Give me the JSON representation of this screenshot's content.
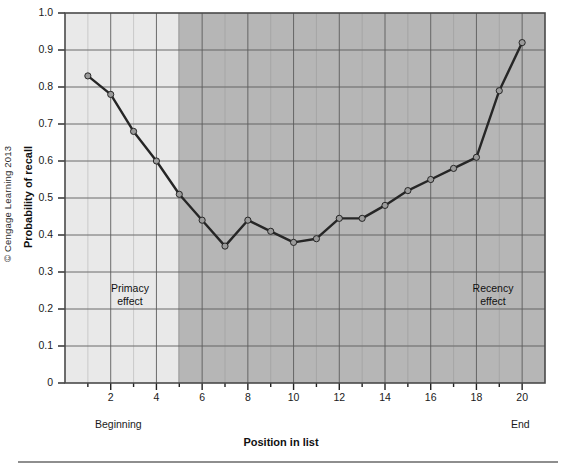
{
  "figure": {
    "copyright": "© Cengage Learning 2013"
  },
  "chart_data": {
    "type": "line",
    "title": "",
    "xlabel": "Position in list",
    "ylabel": "Probability of recall",
    "xlim": [
      0,
      21
    ],
    "ylim": [
      0,
      1.0
    ],
    "grid": true,
    "legend": null,
    "x": [
      1,
      2,
      3,
      4,
      5,
      6,
      7,
      8,
      9,
      10,
      11,
      12,
      13,
      14,
      15,
      16,
      17,
      18,
      19,
      20
    ],
    "values": [
      0.83,
      0.78,
      0.68,
      0.6,
      0.51,
      0.44,
      0.37,
      0.44,
      0.41,
      0.38,
      0.39,
      0.445,
      0.445,
      0.48,
      0.52,
      0.55,
      0.58,
      0.61,
      0.79,
      0.92
    ],
    "series": [
      {
        "name": "Probability of recall",
        "values": [
          0.83,
          0.78,
          0.68,
          0.6,
          0.51,
          0.44,
          0.37,
          0.44,
          0.41,
          0.38,
          0.39,
          0.445,
          0.445,
          0.48,
          0.52,
          0.55,
          0.58,
          0.61,
          0.79,
          0.92
        ]
      }
    ],
    "xticks": [
      2,
      4,
      6,
      8,
      10,
      12,
      14,
      16,
      18,
      20
    ],
    "xticklabels": [
      "2",
      "4",
      "6",
      "8",
      "10",
      "12",
      "14",
      "16",
      "18",
      "20"
    ],
    "yticks": [
      0,
      0.1,
      0.2,
      0.3,
      0.4,
      0.5,
      0.6,
      0.7,
      0.8,
      0.9,
      1.0
    ],
    "yticklabels": [
      "0",
      "0.1",
      "0.2",
      "0.3",
      "0.4",
      "0.5",
      "0.6",
      "0.7",
      "0.8",
      "0.9",
      "1.0"
    ],
    "annotations": [
      {
        "text": "Primacy\neffect",
        "x": 2.6,
        "y": 0.27
      },
      {
        "text": "Recency\neffect",
        "x": 17.6,
        "y": 0.27
      }
    ],
    "axis_end_labels": {
      "left": "Beginning",
      "right": "End"
    },
    "shaded_regions": [
      {
        "from": 0,
        "to": 4.8,
        "color": "#e8e8e8",
        "name": "primacy-band"
      },
      {
        "from": 4.8,
        "to": 21,
        "color": "#b5b5b5",
        "name": "recency-band"
      }
    ],
    "colors": {
      "line": "#262626",
      "marker_fill": "#9a9a9a",
      "marker_edge": "#1a1a1a",
      "grid": "#5c5c5c",
      "axis": "#4a4a4a"
    }
  }
}
